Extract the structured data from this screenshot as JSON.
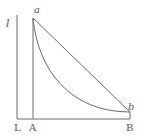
{
  "diagram": {
    "axis_label": "l",
    "point_a_label": "a",
    "point_b_label": "b",
    "base_labels": {
      "L": "L",
      "A": "A",
      "B": "B"
    },
    "colors": {
      "line": "#6a6a6a",
      "text": "#555555",
      "background": "#ffffff"
    }
  }
}
